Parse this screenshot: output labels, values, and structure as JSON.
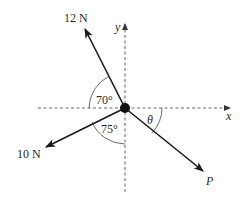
{
  "diagram": {
    "type": "force-diagram",
    "origin": {
      "x": 125,
      "y": 108
    },
    "axes": {
      "x_label": "x",
      "y_label": "y"
    },
    "forces": [
      {
        "id": "f12",
        "label": "12 N",
        "direction": "up-left",
        "angle_to_negative_x_deg": 70
      },
      {
        "id": "f10",
        "label": "10 N",
        "direction": "down-left",
        "angle_to_negative_y_deg": 75
      },
      {
        "id": "fP",
        "label": "P",
        "direction": "down-right",
        "angle_to_positive_x": "θ"
      }
    ],
    "angle_labels": {
      "a70": "70°",
      "a75": "75°",
      "theta": "θ"
    },
    "colors": {
      "line": "#1a1a1a",
      "axis": "#555555",
      "text": "#2a2a2a"
    }
  }
}
